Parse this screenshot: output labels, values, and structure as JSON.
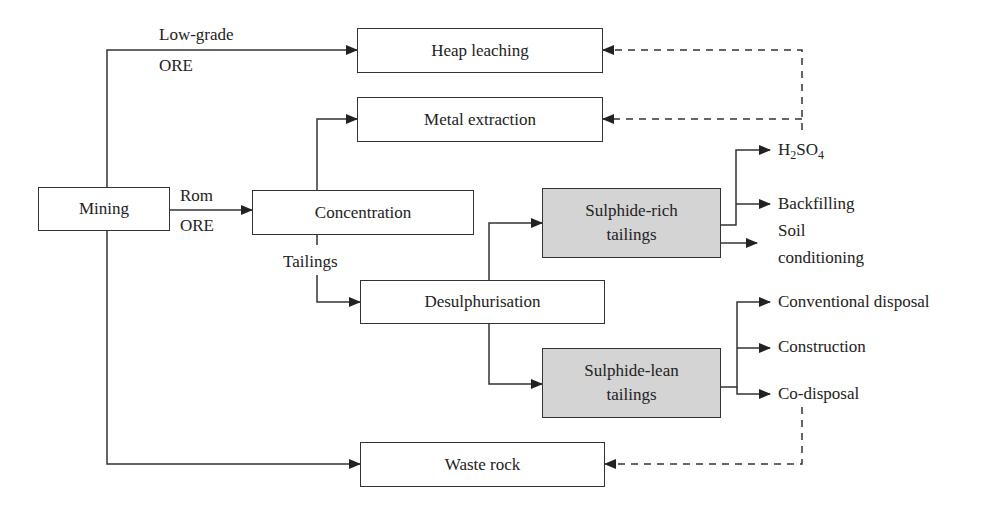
{
  "diagram": {
    "nodes": {
      "mining": "Mining",
      "heap_leaching": "Heap leaching",
      "metal_extraction": "Metal extraction",
      "concentration": "Concentration",
      "desulphurisation": "Desulphurisation",
      "sulphide_rich_line1": "Sulphide-rich",
      "sulphide_rich_line2": "tailings",
      "sulphide_lean_line1": "Sulphide-lean",
      "sulphide_lean_line2": "tailings",
      "waste_rock": "Waste rock"
    },
    "edge_labels": {
      "low_grade": "Low-grade",
      "low_grade_ore": "ORE",
      "rom": "Rom",
      "rom_ore": "ORE",
      "tailings": "Tailings"
    },
    "outputs": {
      "h2so4_h": "H",
      "h2so4_2": "2",
      "h2so4_so": "SO",
      "h2so4_4": "4",
      "backfilling": "Backfilling",
      "soil_line1": "Soil",
      "soil_line2": "conditioning",
      "conventional_disposal": "Conventional disposal",
      "construction": "Construction",
      "co_disposal": "Co-disposal"
    },
    "colors": {
      "line": "#333333",
      "shaded_fill": "#d4d4d4"
    }
  }
}
